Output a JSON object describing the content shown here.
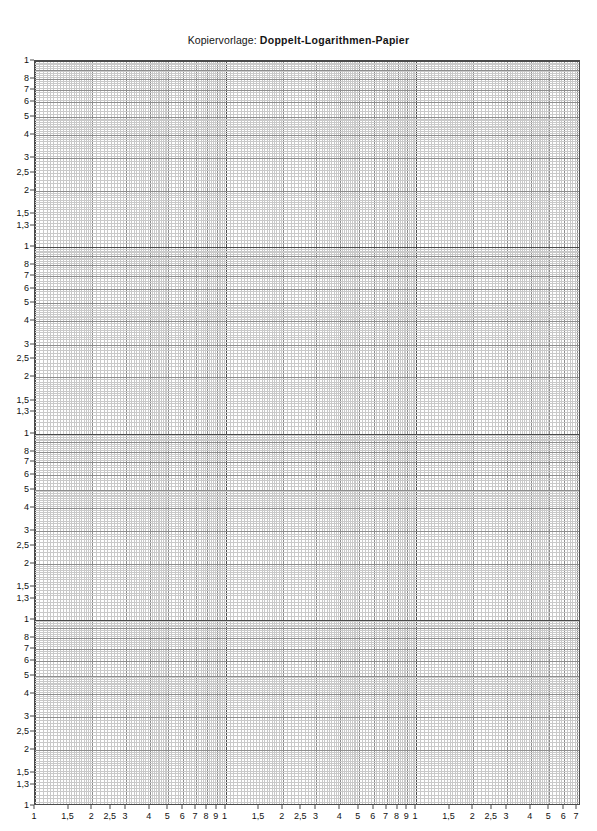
{
  "document": {
    "title_prefix": "Kopiervorlage:",
    "title_main": "Doppelt-Logarithmen-Papier",
    "page_background": "#ffffff"
  },
  "chart_data": {
    "type": "grid",
    "title": "Kopiervorlage: Doppelt-Logarithmen-Papier",
    "subtitle": "",
    "xlabel": "",
    "ylabel": "",
    "xscale": "log",
    "yscale": "log",
    "grid": true,
    "legend": null,
    "series": [],
    "x_decades": 2.866,
    "y_decades": 4.0,
    "x_axis": {
      "decade_count": 3,
      "last_decade_partial_to": 6,
      "labeled_ticks": [
        1,
        1.5,
        2,
        2.5,
        3,
        4,
        5,
        6,
        7,
        8,
        9
      ],
      "tick_labels": [
        "1",
        "1,5",
        "2",
        "2,5",
        "3",
        "4",
        "5",
        "6",
        "7",
        "8",
        "9"
      ],
      "full_sequence": [
        "1",
        "1,5",
        "2",
        "2,5",
        "3",
        "4",
        "5",
        "6",
        "7",
        "8",
        "9",
        "1",
        "1,5",
        "2",
        "2,5",
        "3",
        "4",
        "5",
        "6",
        "7",
        "8",
        "9",
        "1",
        "1,5",
        "2",
        "2,5",
        "3",
        "4",
        "5",
        "6"
      ]
    },
    "y_axis": {
      "decade_count": 4,
      "labeled_ticks": [
        1,
        1.3,
        1.5,
        2,
        2.5,
        3,
        4,
        5,
        6,
        7,
        8
      ],
      "tick_labels_top_to_bottom": [
        "1",
        "8",
        "7",
        "6",
        "5",
        "4",
        "3",
        "2,5",
        "2",
        "1,5",
        "1,3"
      ],
      "full_sequence_top_to_bottom": [
        "1",
        "8",
        "7",
        "6",
        "5",
        "4",
        "3",
        "2,5",
        "2",
        "1,5",
        "1,3",
        "1",
        "8",
        "7",
        "6",
        "5",
        "4",
        "3",
        "2,5",
        "2",
        "1,5",
        "1,3",
        "1",
        "8",
        "7",
        "6",
        "5",
        "4",
        "3",
        "2,5",
        "2",
        "1,5",
        "1,3",
        "1",
        "8",
        "7",
        "6",
        "5",
        "4",
        "3",
        "2,5",
        "2",
        "1,5",
        "1,3",
        "1"
      ]
    },
    "colors": {
      "decade_line": "#4a4a4a",
      "major_line": "#8d8d8d",
      "minor_line": "#c9c9c9",
      "text": "#111111",
      "background": "#ffffff"
    }
  }
}
